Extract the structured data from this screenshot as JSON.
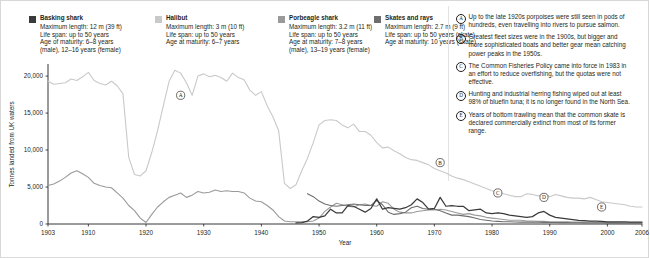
{
  "colors": {
    "basking": "#3a3a3a",
    "halibut": "#c9c9c9",
    "porbeagle": "#9a9a9a",
    "skates": "#6e6e6e",
    "axis": "#231f20",
    "text": "#231f20"
  },
  "legend": [
    {
      "label": "Basking shark",
      "swatch": "#3a3a3a",
      "lines": [
        "Maximum length: 12 m (39 ft)",
        "Life span: up to 50 years",
        "Age of maturity: 6–8 years",
        "(male), 12–16 years (female)"
      ]
    },
    {
      "label": "Halibut",
      "swatch": "#c9c9c9",
      "lines": [
        "Maximum length: 3 m (10 ft)",
        "Life span: up to 50 years",
        "Age at maturity: 6–7 years"
      ]
    },
    {
      "label": "Porbeagle shark",
      "swatch": "#9a9a9a",
      "lines": [
        "Maximum length: 3.2 m (11 ft)",
        "Life span: up to 50 years",
        "Age at maturity: 7–8 years",
        "(male), 13–19 years (female)"
      ]
    },
    {
      "label": "Skates and rays",
      "swatch": "#6e6e6e",
      "lines": [
        "Maximum length: 2.7 m (9 ft)",
        "Life span: up to 50 years (skate)",
        "Age at maturity: 10 years (skate)"
      ]
    }
  ],
  "notes": [
    {
      "key": "A",
      "text": "Up to the late 1920s porpoises were still seen in pods of hundreds, even travelling into rivers to pursue salmon."
    },
    {
      "key": "B",
      "text": "Greatest fleet sizes were in the 1900s, but bigger and more sophisticated boats and better gear mean catching power peaks in the 1950s."
    },
    {
      "key": "C",
      "text": "The Common Fisheries Policy came into force in 1983 in an effort to reduce overfishing, but the quotas were not effective."
    },
    {
      "key": "D",
      "text": "Hunting and industrial herring fishing wiped out at least 98% of bluefin tuna; it is no longer found in the North Sea."
    },
    {
      "key": "E",
      "text": "Years of bottom trawling mean that the common skate is declared commercially extinct from most of its former range."
    }
  ],
  "markers": [
    {
      "key": "A",
      "x": 1926,
      "y": 17400
    },
    {
      "key": "B",
      "x": 1971,
      "y": 8300
    },
    {
      "key": "C",
      "x": 1981,
      "y": 4200
    },
    {
      "key": "D",
      "x": 1989,
      "y": 3600
    },
    {
      "key": "E",
      "x": 1999,
      "y": 2300
    }
  ],
  "chart_data": {
    "type": "line",
    "title": "",
    "xlabel": "Year",
    "ylabel": "Tonnes landed from UK waters",
    "xlim": [
      1903,
      2006
    ],
    "ylim": [
      0,
      21500
    ],
    "yticks": [
      0,
      5000,
      10000,
      15000,
      20000
    ],
    "ytick_labels": [
      "0",
      "5,000",
      "10,000",
      "15,000",
      "20,000"
    ],
    "xticks": [
      1903,
      1910,
      1920,
      1930,
      1940,
      1950,
      1960,
      1970,
      1980,
      1990,
      2000,
      2006
    ],
    "xtick_labels": [
      "1903",
      "1910",
      "1920",
      "1930",
      "1940",
      "1950",
      "1960",
      "1970",
      "1980",
      "1990",
      "2000",
      "2006"
    ],
    "grid": false,
    "legend_position": "top",
    "series": [
      {
        "name": "Halibut",
        "color": "#c9c9c9",
        "width": 1.1,
        "x": [
          1903,
          1904,
          1905,
          1906,
          1907,
          1908,
          1909,
          1910,
          1911,
          1912,
          1913,
          1914,
          1915,
          1916,
          1917,
          1918,
          1919,
          1920,
          1921,
          1922,
          1923,
          1924,
          1925,
          1926,
          1927,
          1928,
          1929,
          1930,
          1931,
          1932,
          1933,
          1934,
          1935,
          1936,
          1937,
          1938,
          1939,
          1940,
          1941,
          1942,
          1943,
          1944,
          1945,
          1946,
          1947,
          1948,
          1949,
          1950,
          1951,
          1952,
          1953,
          1954,
          1955,
          1956,
          1957,
          1958,
          1959,
          1960,
          1961,
          1962,
          1963,
          1964,
          1965,
          1966,
          1967,
          1968,
          1969,
          1970,
          1971,
          1972,
          1973,
          1974,
          1975,
          1976,
          1977,
          1978,
          1979,
          1980,
          1981,
          1982,
          1983,
          1984,
          1985,
          1986,
          1987,
          1988,
          1989,
          1990,
          1991,
          1992,
          1993,
          1994,
          1995,
          1996,
          1997,
          1998,
          1999,
          2000,
          2001,
          2002,
          2003,
          2004,
          2005,
          2006
        ],
        "y": [
          19300,
          18900,
          19000,
          19100,
          19600,
          19400,
          19900,
          20500,
          19400,
          19000,
          18800,
          19300,
          18700,
          17600,
          9000,
          6700,
          6500,
          7200,
          9700,
          12600,
          16000,
          19300,
          20800,
          20400,
          19100,
          17400,
          20000,
          20300,
          19900,
          20100,
          19800,
          19300,
          20400,
          19800,
          19500,
          18100,
          17400,
          17900,
          16000,
          14500,
          12600,
          5500,
          4800,
          5300,
          7200,
          8900,
          11000,
          13400,
          14000,
          14100,
          14000,
          13400,
          13000,
          13500,
          12500,
          12500,
          12000,
          11000,
          10300,
          10400,
          9900,
          9500,
          9000,
          8700,
          8600,
          8300,
          8000,
          7500,
          7200,
          6900,
          6500,
          6200,
          6000,
          5700,
          5400,
          5100,
          4800,
          4500,
          4300,
          4100,
          3900,
          3700,
          3700,
          4100,
          4000,
          3800,
          4100,
          3700,
          4000,
          3800,
          3600,
          3500,
          3500,
          3400,
          3600,
          3300,
          3000,
          2900,
          2800,
          2700,
          2600,
          2400,
          2300,
          2300
        ]
      },
      {
        "name": "Porbeagle shark",
        "color": "#9a9a9a",
        "width": 1.1,
        "x": [
          1903,
          1904,
          1905,
          1906,
          1907,
          1908,
          1909,
          1910,
          1911,
          1912,
          1913,
          1914,
          1915,
          1916,
          1917,
          1918,
          1919,
          1920,
          1921,
          1922,
          1923,
          1924,
          1925,
          1926,
          1927,
          1928,
          1929,
          1930,
          1931,
          1932,
          1933,
          1934,
          1935,
          1936,
          1937,
          1938,
          1939,
          1940,
          1941,
          1942,
          1943,
          1944,
          1945,
          1946,
          1947,
          1948,
          1949,
          1950,
          1951,
          1952,
          1953,
          1954,
          1955,
          1956,
          1957,
          1958,
          1959,
          1960,
          1961,
          1962,
          1963,
          1964,
          1965,
          1966,
          1967,
          1968,
          1969,
          1970,
          1971,
          1972,
          1973,
          1974,
          1975,
          1976,
          1977,
          1978,
          1979,
          1980,
          1981,
          1982,
          1983,
          1984,
          1985,
          1986,
          1987,
          1988,
          1989,
          1990,
          1991,
          1992,
          1993,
          1994,
          1995,
          1996,
          1997,
          1998,
          1999,
          2000,
          2001,
          2002,
          2003,
          2004,
          2005,
          2006
        ],
        "y": [
          5200,
          5400,
          5800,
          6300,
          6900,
          7200,
          6800,
          6300,
          5500,
          5200,
          5000,
          4900,
          4200,
          3500,
          2500,
          1800,
          800,
          200,
          1300,
          2300,
          3000,
          3600,
          3900,
          4200,
          3600,
          3900,
          4400,
          4200,
          4300,
          4600,
          4400,
          4500,
          4400,
          4400,
          4200,
          3500,
          3100,
          3000,
          2500,
          1900,
          1000,
          400,
          300,
          300,
          300,
          300,
          400,
          800,
          1700,
          2300,
          2800,
          2600,
          2400,
          2300,
          2600,
          2700,
          2500,
          2400,
          3000,
          2800,
          2000,
          1600,
          1500,
          1500,
          1700,
          1800,
          1900,
          1900,
          2000,
          1900,
          1700,
          1500,
          1300,
          1400,
          1200,
          1100,
          900,
          800,
          700,
          600,
          500,
          500,
          500,
          400,
          400,
          350,
          350,
          300,
          300,
          300,
          300,
          250,
          250,
          250,
          250,
          200,
          200,
          200,
          200,
          200,
          150,
          150,
          150,
          150
        ]
      },
      {
        "name": "Skates and rays",
        "color": "#6e6e6e",
        "width": 1.1,
        "x": [
          1948,
          1949,
          1950,
          1951,
          1952,
          1953,
          1954,
          1955,
          1956,
          1957,
          1958,
          1959,
          1960,
          1961,
          1962,
          1963,
          1964,
          1965,
          1966,
          1967,
          1968,
          1969,
          1970,
          1971,
          1972,
          1973,
          1974,
          1975,
          1976,
          1977,
          1978,
          1979,
          1980,
          1981,
          1982,
          1983,
          1984,
          1985,
          1986,
          1987,
          1988,
          1989,
          1990,
          1991,
          1992,
          1993,
          1994,
          1995,
          1996,
          1997,
          1998,
          1999,
          2000,
          2001,
          2002,
          2003,
          2004,
          2005,
          2006
        ],
        "y": [
          4100,
          3700,
          3100,
          2700,
          2500,
          2400,
          2500,
          2600,
          2700,
          2600,
          2500,
          2500,
          3200,
          2600,
          1600,
          1300,
          1400,
          1600,
          2200,
          2400,
          2100,
          2000,
          2000,
          1800,
          1500,
          1200,
          1200,
          1100,
          1000,
          800,
          600,
          500,
          400,
          350,
          300,
          300,
          280,
          260,
          250,
          250,
          230,
          220,
          210,
          200,
          190,
          180,
          170,
          160,
          150,
          140,
          140,
          130,
          120,
          110,
          100,
          100,
          100,
          100,
          100
        ]
      },
      {
        "name": "Basking shark",
        "color": "#3a3a3a",
        "width": 1.25,
        "x": [
          1946,
          1947,
          1948,
          1949,
          1950,
          1951,
          1952,
          1953,
          1954,
          1955,
          1956,
          1957,
          1958,
          1959,
          1960,
          1961,
          1962,
          1963,
          1964,
          1965,
          1966,
          1967,
          1968,
          1969,
          1970,
          1971,
          1972,
          1973,
          1974,
          1975,
          1976,
          1977,
          1978,
          1979,
          1980,
          1981,
          1982,
          1983,
          1984,
          1985,
          1986,
          1987,
          1988,
          1989,
          1990,
          1991,
          1992,
          1993,
          1994,
          1995,
          1996,
          1997,
          1998,
          1999,
          2000,
          2001,
          2002,
          2003,
          2004,
          2005,
          2006
        ],
        "y": [
          150,
          200,
          400,
          1000,
          900,
          1100,
          2000,
          1500,
          1500,
          2500,
          2400,
          2000,
          1600,
          2100,
          3400,
          2000,
          2200,
          2100,
          2000,
          2200,
          2600,
          3400,
          2900,
          2000,
          2100,
          3600,
          2400,
          2500,
          2400,
          2400,
          1800,
          1900,
          2000,
          1500,
          1400,
          1500,
          1400,
          1200,
          1100,
          1000,
          900,
          1000,
          1500,
          1700,
          1200,
          900,
          800,
          700,
          600,
          500,
          450,
          400,
          400,
          350,
          300,
          300,
          300,
          280,
          260,
          250,
          250
        ]
      }
    ]
  }
}
